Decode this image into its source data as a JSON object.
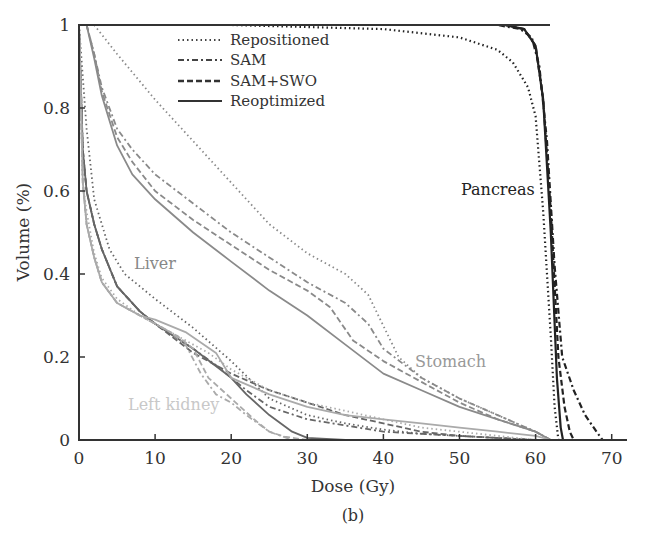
{
  "chart_data": {
    "type": "line",
    "title": "",
    "caption": "(b)",
    "xlabel": "Dose (Gy)",
    "ylabel": "Volume (%)",
    "xlim": [
      0,
      72
    ],
    "ylim": [
      0,
      1
    ],
    "xticks": [
      0,
      10,
      20,
      30,
      40,
      50,
      60,
      70
    ],
    "yticks": [
      0,
      0.2,
      0.4,
      0.6,
      0.8,
      1
    ],
    "ytick_labels": [
      "0",
      "0.2",
      "0.4",
      "0.6",
      "0.8",
      "1"
    ],
    "grid": false,
    "legend": {
      "position": "upper-center-left",
      "entries": [
        {
          "label": "Repositioned",
          "style": "dotted"
        },
        {
          "label": "SAM",
          "style": "dash-dot"
        },
        {
          "label": "SAM+SWO",
          "style": "dashed"
        },
        {
          "label": "Reoptimized",
          "style": "solid"
        }
      ]
    },
    "annotations": [
      {
        "text": "Pancreas",
        "x": 52,
        "y": 0.61,
        "color": "#222222"
      },
      {
        "text": "Liver",
        "x": 3,
        "y": 0.42,
        "color": "#888888"
      },
      {
        "text": "Stomach",
        "x": 46,
        "y": 0.19,
        "color": "#999999"
      },
      {
        "text": "Left kidney",
        "x": 9,
        "y": 0.08,
        "color": "#c8c8c8"
      }
    ],
    "series": [
      {
        "organ": "Pancreas",
        "name": "Repositioned",
        "style": "dotted",
        "color": "#222222",
        "x": [
          0,
          20,
          40,
          50,
          55,
          57,
          59,
          60,
          61,
          62,
          62.5,
          63
        ],
        "y": [
          1,
          1,
          0.99,
          0.97,
          0.94,
          0.91,
          0.85,
          0.78,
          0.55,
          0.25,
          0.08,
          0
        ]
      },
      {
        "organ": "Pancreas",
        "name": "SAM",
        "style": "dash-dot",
        "color": "#222222",
        "x": [
          0,
          55,
          58,
          59.5,
          60.5,
          61.5,
          62.5,
          63.5,
          65,
          66.5,
          68,
          68.8
        ],
        "y": [
          1,
          1,
          0.99,
          0.97,
          0.9,
          0.72,
          0.42,
          0.2,
          0.12,
          0.06,
          0.02,
          0
        ]
      },
      {
        "organ": "Pancreas",
        "name": "SAM+SWO",
        "style": "dashed",
        "color": "#222222",
        "x": [
          0,
          56,
          58.5,
          60,
          61,
          62,
          63,
          63.8,
          64.5,
          65
        ],
        "y": [
          1,
          1,
          0.99,
          0.95,
          0.82,
          0.55,
          0.2,
          0.08,
          0.02,
          0
        ]
      },
      {
        "organ": "Pancreas",
        "name": "Reoptimized",
        "style": "solid",
        "color": "#222222",
        "x": [
          0,
          56,
          58.5,
          60,
          61,
          62,
          62.8,
          63.3,
          63.6
        ],
        "y": [
          1,
          1,
          0.99,
          0.95,
          0.82,
          0.5,
          0.15,
          0.03,
          0
        ]
      },
      {
        "organ": "Stomach",
        "name": "Repositioned",
        "style": "dotted",
        "color": "#8a8a8a",
        "x": [
          2,
          5,
          10,
          15,
          20,
          25,
          30,
          35,
          38,
          42,
          45,
          50,
          55,
          60,
          62
        ],
        "y": [
          1,
          0.93,
          0.82,
          0.72,
          0.62,
          0.52,
          0.45,
          0.4,
          0.35,
          0.2,
          0.15,
          0.1,
          0.06,
          0.02,
          0
        ]
      },
      {
        "organ": "Stomach",
        "name": "SAM",
        "style": "dash-dot",
        "color": "#8a8a8a",
        "x": [
          1,
          2,
          3,
          5,
          7,
          10,
          15,
          20,
          25,
          30,
          35,
          38,
          40,
          45,
          50,
          55,
          60,
          62
        ],
        "y": [
          1,
          0.93,
          0.85,
          0.75,
          0.7,
          0.64,
          0.57,
          0.5,
          0.44,
          0.38,
          0.33,
          0.28,
          0.22,
          0.15,
          0.1,
          0.06,
          0.02,
          0
        ]
      },
      {
        "organ": "Stomach",
        "name": "SAM+SWO",
        "style": "dashed",
        "color": "#8a8a8a",
        "x": [
          1,
          2,
          3,
          5,
          7,
          10,
          15,
          20,
          25,
          30,
          33,
          36,
          40,
          45,
          50,
          55,
          60,
          62
        ],
        "y": [
          1,
          0.93,
          0.84,
          0.73,
          0.67,
          0.6,
          0.53,
          0.47,
          0.41,
          0.36,
          0.32,
          0.24,
          0.19,
          0.14,
          0.09,
          0.05,
          0.02,
          0
        ]
      },
      {
        "organ": "Stomach",
        "name": "Reoptimized",
        "style": "solid",
        "color": "#8a8a8a",
        "x": [
          1,
          2,
          3,
          5,
          7,
          10,
          15,
          20,
          25,
          30,
          35,
          40,
          45,
          50,
          55,
          60,
          62
        ],
        "y": [
          1,
          0.92,
          0.83,
          0.71,
          0.64,
          0.58,
          0.5,
          0.43,
          0.36,
          0.3,
          0.23,
          0.16,
          0.12,
          0.08,
          0.05,
          0.02,
          0
        ]
      },
      {
        "organ": "Liver",
        "name": "Repositioned",
        "style": "dotted",
        "color": "#666666",
        "x": [
          0,
          1,
          2,
          4,
          6,
          8,
          10,
          15,
          20,
          25,
          30,
          35,
          40,
          45,
          50,
          55,
          60
        ],
        "y": [
          1,
          0.75,
          0.58,
          0.46,
          0.4,
          0.37,
          0.34,
          0.27,
          0.19,
          0.1,
          0.06,
          0.04,
          0.025,
          0.015,
          0.01,
          0.005,
          0
        ]
      },
      {
        "organ": "Liver",
        "name": "SAM",
        "style": "dash-dot",
        "color": "#666666",
        "x": [
          0,
          0.5,
          1,
          2,
          3,
          5,
          8,
          10,
          15,
          18,
          20,
          22,
          25,
          30,
          40,
          50,
          60
        ],
        "y": [
          1,
          0.7,
          0.6,
          0.52,
          0.46,
          0.37,
          0.31,
          0.28,
          0.22,
          0.18,
          0.15,
          0.12,
          0.08,
          0.05,
          0.02,
          0.01,
          0
        ]
      },
      {
        "organ": "Liver",
        "name": "SAM+SWO",
        "style": "dashed",
        "color": "#666666",
        "x": [
          0,
          0.5,
          1,
          2,
          3,
          5,
          8,
          10,
          15,
          20,
          25,
          30,
          35,
          40,
          45,
          50,
          60
        ],
        "y": [
          1,
          0.7,
          0.6,
          0.52,
          0.46,
          0.37,
          0.31,
          0.28,
          0.21,
          0.16,
          0.12,
          0.09,
          0.06,
          0.04,
          0.02,
          0.01,
          0
        ]
      },
      {
        "organ": "Liver",
        "name": "Reoptimized",
        "style": "solid",
        "color": "#666666",
        "x": [
          0,
          0.5,
          1,
          2,
          3,
          5,
          8,
          10,
          15,
          20,
          22,
          25,
          28,
          30,
          35
        ],
        "y": [
          1,
          0.7,
          0.6,
          0.52,
          0.46,
          0.37,
          0.31,
          0.28,
          0.22,
          0.15,
          0.11,
          0.06,
          0.02,
          0.005,
          0
        ]
      },
      {
        "organ": "Left kidney",
        "name": "Repositioned",
        "style": "dotted",
        "color": "#aaaaaa",
        "x": [
          0,
          0.5,
          1,
          2,
          3,
          5,
          8,
          10,
          14,
          17,
          20,
          25,
          30,
          35,
          40,
          45,
          50,
          55,
          60
        ],
        "y": [
          1,
          0.62,
          0.55,
          0.45,
          0.39,
          0.34,
          0.3,
          0.28,
          0.24,
          0.21,
          0.17,
          0.12,
          0.09,
          0.07,
          0.05,
          0.03,
          0.02,
          0.01,
          0
        ]
      },
      {
        "organ": "Left kidney",
        "name": "SAM",
        "style": "dash-dot",
        "color": "#aaaaaa",
        "x": [
          0,
          0.5,
          1,
          2,
          3,
          5,
          8,
          10,
          12,
          14,
          16,
          18,
          20,
          22,
          25,
          28
        ],
        "y": [
          1,
          0.62,
          0.52,
          0.44,
          0.38,
          0.33,
          0.3,
          0.28,
          0.26,
          0.23,
          0.16,
          0.11,
          0.09,
          0.06,
          0.02,
          0
        ]
      },
      {
        "organ": "Left kidney",
        "name": "SAM+SWO",
        "style": "dashed",
        "color": "#aaaaaa",
        "x": [
          0,
          0.5,
          1,
          2,
          3,
          5,
          8,
          10,
          13,
          15,
          17,
          20,
          23,
          25,
          27,
          30
        ],
        "y": [
          1,
          0.62,
          0.52,
          0.44,
          0.38,
          0.33,
          0.3,
          0.28,
          0.25,
          0.22,
          0.15,
          0.1,
          0.05,
          0.02,
          0.008,
          0
        ]
      },
      {
        "organ": "Left kidney",
        "name": "Reoptimized",
        "style": "solid",
        "color": "#aaaaaa",
        "x": [
          0,
          0.5,
          1,
          2,
          3,
          5,
          8,
          10,
          14,
          18,
          20,
          25,
          30,
          35,
          40,
          45,
          50,
          55,
          60,
          62
        ],
        "y": [
          1,
          0.62,
          0.52,
          0.44,
          0.38,
          0.33,
          0.3,
          0.29,
          0.26,
          0.21,
          0.15,
          0.11,
          0.08,
          0.06,
          0.05,
          0.04,
          0.03,
          0.02,
          0.01,
          0
        ]
      }
    ]
  },
  "layout": {
    "plot_left_px": 79,
    "plot_bottom_px": 440,
    "plot_top_px": 25,
    "px_per_gy": 7.61,
    "px_per_unit_volume": 415,
    "axis_right_px": 627
  }
}
